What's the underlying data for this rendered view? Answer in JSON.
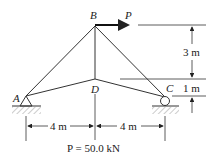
{
  "diagram": {
    "type": "truss",
    "nodes": {
      "A": {
        "label": "A",
        "support": "pin"
      },
      "B": {
        "label": "B"
      },
      "C": {
        "label": "C",
        "support": "roller"
      },
      "D": {
        "label": "D"
      }
    },
    "members": [
      "A-B",
      "B-C",
      "B-D",
      "A-D",
      "D-C"
    ],
    "load": {
      "label": "P",
      "at": "B",
      "direction": "right"
    },
    "dimensions": {
      "vertical_top": "3 m",
      "vertical_bottom": "1 m",
      "horizontal_left": "4 m",
      "horizontal_right": "4 m"
    },
    "caption": "P = 50.0 kN"
  }
}
